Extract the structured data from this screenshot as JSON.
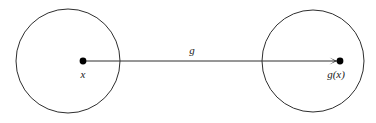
{
  "diagram": {
    "type": "function-mapping-diagram",
    "background_color": "#ffffff",
    "stroke_color": "#2e2e2e",
    "dot_color": "#000000",
    "text_color": "#1a1a1a",
    "domain_circle": {
      "name": "domain-set",
      "cx": 68,
      "cy": 61,
      "r": 52
    },
    "codomain_circle": {
      "name": "codomain-set",
      "cx": 313,
      "cy": 61,
      "r": 51
    },
    "source_point": {
      "label": "x",
      "cx": 83,
      "cy": 61,
      "r": 3.4,
      "label_x": 83,
      "label_y": 78
    },
    "target_point": {
      "label": "g(x)",
      "cx": 340,
      "cy": 61,
      "r": 3.4,
      "label_x": 336,
      "label_y": 78
    },
    "arrow": {
      "label": "g",
      "x1": 85,
      "y1": 61,
      "x2": 337,
      "y2": 61,
      "label_x": 192,
      "label_y": 54
    }
  }
}
